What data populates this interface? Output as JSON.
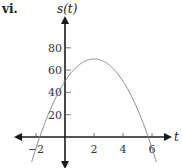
{
  "panel_label": "vi.",
  "colors": {
    "axis": "#1a1a1a",
    "curve": "#8a8a8a",
    "text": "#333333"
  },
  "chart_data": {
    "type": "line",
    "title": "",
    "panel_label": "vi.",
    "xlabel": "t",
    "ylabel": "s(t)",
    "xlim": [
      -3.5,
      7
    ],
    "ylim": [
      -20,
      100
    ],
    "x_ticks": [
      -2,
      2,
      4,
      6
    ],
    "x_tick_labels": [
      "-2",
      "2",
      "4",
      "6"
    ],
    "y_ticks": [
      20,
      40,
      60,
      80
    ],
    "y_tick_labels": [
      "20",
      "40",
      "60",
      "80"
    ],
    "grid": false,
    "legend": null,
    "series": [
      {
        "name": "s(t)",
        "description": "downward-opening parabola, vertex near (2, 70), y-intercept near 50, roots near t=-1.7 and t=5.7",
        "x": [
          -2.2,
          -1.7,
          -1,
          0,
          1,
          2,
          3,
          4,
          5,
          5.7,
          6.2
        ],
        "y": [
          -8,
          0,
          25,
          50,
          65,
          70,
          65,
          50,
          25,
          0,
          -20
        ]
      }
    ]
  }
}
